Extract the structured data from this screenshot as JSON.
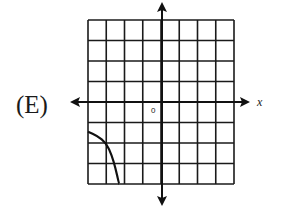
{
  "option": {
    "label": "(E)"
  },
  "chart_data": {
    "type": "line",
    "title": "",
    "xlabel": "x",
    "ylabel": "",
    "origin_label": "0",
    "xlim": [
      -4,
      4
    ],
    "ylim": [
      -4,
      4
    ],
    "grid": true,
    "grid_cells": {
      "columns": 8,
      "rows": 8
    },
    "series": [
      {
        "name": "curve",
        "points": [
          [
            -4,
            -1.45
          ],
          [
            -3.5,
            -1.65
          ],
          [
            -3,
            -2
          ],
          [
            -2.7,
            -2.6
          ],
          [
            -2.5,
            -3.2
          ],
          [
            -2.3,
            -4
          ]
        ]
      }
    ],
    "legend": null
  },
  "colors": {
    "ink": "#111111",
    "background": "#ffffff"
  }
}
